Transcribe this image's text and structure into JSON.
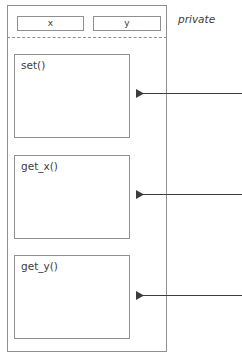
{
  "diagram": {
    "type": "uml-class-diagram",
    "title": "",
    "stereotype_label": "private",
    "colors": {
      "stroke": "#8f8f8f",
      "arrow": "#3c3c3c",
      "text": "#3c3c3c",
      "background": "#ffffff"
    },
    "attributes": [
      {
        "name": "x-attribute",
        "label": "x"
      },
      {
        "name": "y-attribute",
        "label": "y"
      }
    ],
    "methods": [
      {
        "name": "set-method",
        "label": "set()",
        "annotated": true
      },
      {
        "name": "get-x-method",
        "label": "get_x()",
        "annotated": true
      },
      {
        "name": "get-y-method",
        "label": "get_y()",
        "annotated": true
      }
    ],
    "annotation_arrows": [
      {
        "name": "arrow-to-set",
        "target": "set()",
        "direction": "left",
        "label": ""
      },
      {
        "name": "arrow-to-get-x",
        "target": "get_x()",
        "direction": "left",
        "label": ""
      },
      {
        "name": "arrow-to-get-y",
        "target": "get_y()",
        "direction": "left",
        "label": ""
      }
    ],
    "divider": {
      "style": "dashed",
      "name": "visibility-divider"
    }
  }
}
